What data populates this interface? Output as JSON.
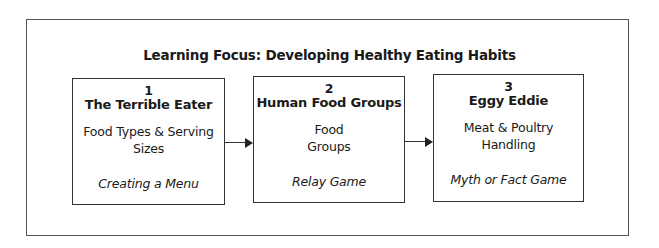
{
  "diagram": {
    "title": "Learning Focus: Developing Healthy Eating Habits",
    "steps": [
      {
        "number": "1",
        "name": "The Terrible Eater",
        "topic_lines": [
          "Food Types & Serving",
          "Sizes"
        ],
        "activity": "Creating a Menu"
      },
      {
        "number": "2",
        "name": "Human Food Groups",
        "topic_lines": [
          "Food",
          "Groups"
        ],
        "activity": "Relay Game"
      },
      {
        "number": "3",
        "name": "Eggy Eddie",
        "topic_lines": [
          "Meat & Poultry",
          "Handling"
        ],
        "activity": "Myth or Fact Game"
      }
    ],
    "connectors": [
      {
        "from": "1",
        "to": "2"
      },
      {
        "from": "2",
        "to": "3"
      }
    ]
  }
}
